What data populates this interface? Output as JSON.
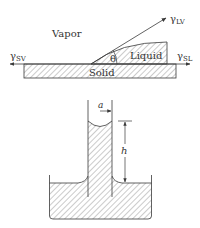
{
  "figure": {
    "top": {
      "title": "Contact angle at solid-liquid-vapor interface",
      "labels": {
        "vapor": "Vapor",
        "liquid": "Liquid",
        "solid": "Solid",
        "theta": "θ",
        "gamma_lv": "γ",
        "gamma_lv_sub": "LV",
        "gamma_sv": "γ",
        "gamma_sv_sub": "SV",
        "gamma_sl": "γ",
        "gamma_sl_sub": "SL"
      }
    },
    "bottom": {
      "title": "Capillary rise in a tube",
      "labels": {
        "radius": "a",
        "height": "h"
      }
    }
  },
  "colors": {
    "stroke": "#3a3a3a",
    "hatch": "#6a6a6a",
    "background": "#ffffff"
  }
}
